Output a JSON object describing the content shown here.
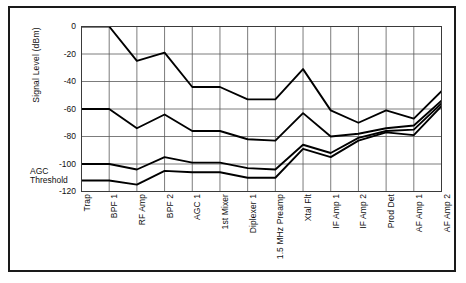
{
  "chart_data": {
    "type": "line",
    "title": "",
    "xlabel": "",
    "ylabel": "Signal Level (dBm)",
    "ylim": [
      -120,
      0
    ],
    "yticks": [
      0,
      -20,
      -40,
      -60,
      -80,
      -100,
      -120
    ],
    "ytick_labels": [
      "0",
      "-20",
      "-40",
      "-60",
      "-80",
      "-100",
      "-120"
    ],
    "grid": true,
    "legend": "none",
    "categories": [
      "Trap",
      "BPF 1",
      "RF Amp",
      "BPF 2",
      "AGC 1",
      "1st Mixer",
      "Diplexer 1",
      "1.5 MHz Preamp",
      "Xtal Flt",
      "IF Amp 1",
      "IF Amp 2",
      "Prod Det",
      "AF Amp 1",
      "AF Amp 2"
    ],
    "series": [
      {
        "name": "Maximum signal level",
        "values": [
          0,
          0,
          -25,
          -19,
          -44,
          -44,
          -53,
          -53,
          -31,
          -61,
          -70,
          -61,
          -67,
          -47
        ]
      },
      {
        "name": "Strong signal level",
        "values": [
          -60,
          -60,
          -74,
          -64,
          -76,
          -76,
          -82,
          -83,
          -63,
          -80,
          -78,
          -74,
          -72,
          -54
        ]
      },
      {
        "name": "Weak signal level",
        "values": [
          -100,
          -100,
          -104,
          -95,
          -99,
          -99,
          -103,
          -104,
          -86,
          -92,
          -81,
          -76,
          -75,
          -56
        ]
      },
      {
        "name": "Noise floor level",
        "values": [
          -112,
          -112,
          -115,
          -105,
          -106,
          -106,
          -110,
          -110,
          -89,
          -95,
          -83,
          -77,
          -79,
          -58
        ]
      }
    ],
    "annotations": [
      {
        "name": "agc-threshold",
        "line1": "AGC",
        "line2": "Threshold",
        "y_value": -110
      }
    ]
  }
}
